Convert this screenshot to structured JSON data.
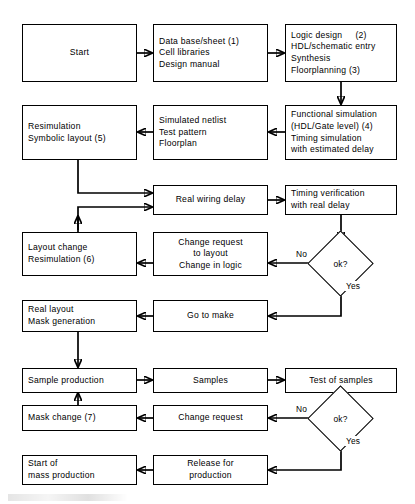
{
  "diagram": {
    "type": "flowchart",
    "line_color": "#000000",
    "background_color": "#ffffff"
  },
  "nodes": [
    {
      "id": "start",
      "shape": "process",
      "align": "center",
      "lines": [
        "Start"
      ]
    },
    {
      "id": "database",
      "shape": "process",
      "align": "left",
      "lines": [
        "Data base/sheet (1)",
        "Cell libraries",
        "Design manual"
      ]
    },
    {
      "id": "logic_design",
      "shape": "process",
      "align": "left",
      "lines": [
        "Logic design     (2)",
        "HDL/schematic entry",
        "Synthesis",
        "Floorplanning (3)"
      ]
    },
    {
      "id": "resimulation",
      "shape": "process",
      "align": "left",
      "lines": [
        "Resimulation",
        "Symbolic layout (5)"
      ]
    },
    {
      "id": "sim_netlist",
      "shape": "process",
      "align": "left",
      "lines": [
        "Simulated netlist",
        "Test pattern",
        "Floorplan"
      ]
    },
    {
      "id": "func_sim",
      "shape": "process",
      "align": "left",
      "lines": [
        "Functional simulation",
        "(HDL/Gate level) (4)",
        "Timing simulation",
        "with estimated delay"
      ]
    },
    {
      "id": "real_wiring",
      "shape": "process",
      "align": "center",
      "lines": [
        "Real wiring delay"
      ]
    },
    {
      "id": "timing_verif",
      "shape": "process",
      "align": "left",
      "lines": [
        "Timing verification",
        "with real delay"
      ]
    },
    {
      "id": "layout_change",
      "shape": "process",
      "align": "left",
      "lines": [
        "Layout change",
        "Resimulation (6)"
      ]
    },
    {
      "id": "change_request_layout",
      "shape": "process",
      "align": "center",
      "lines": [
        "Change request",
        "to layout",
        "Change in logic"
      ]
    },
    {
      "id": "ok1",
      "shape": "decision",
      "align": "center",
      "lines": [
        "ok?"
      ]
    },
    {
      "id": "real_layout",
      "shape": "process",
      "align": "left",
      "lines": [
        "Real layout",
        "Mask generation"
      ]
    },
    {
      "id": "go_to_make",
      "shape": "process",
      "align": "center",
      "lines": [
        "Go to make"
      ]
    },
    {
      "id": "sample_production",
      "shape": "process",
      "align": "left",
      "lines": [
        "Sample production"
      ]
    },
    {
      "id": "samples",
      "shape": "process",
      "align": "center",
      "lines": [
        "Samples"
      ]
    },
    {
      "id": "test_samples",
      "shape": "process",
      "align": "center",
      "lines": [
        "Test of samples"
      ]
    },
    {
      "id": "mask_change",
      "shape": "process",
      "align": "left",
      "lines": [
        "Mask change (7)"
      ]
    },
    {
      "id": "change_request",
      "shape": "process",
      "align": "center",
      "lines": [
        "Change request"
      ]
    },
    {
      "id": "ok2",
      "shape": "decision",
      "align": "center",
      "lines": [
        "ok?"
      ]
    },
    {
      "id": "start_mass",
      "shape": "process",
      "align": "left",
      "lines": [
        "Start of",
        "mass production"
      ]
    },
    {
      "id": "release",
      "shape": "process",
      "align": "center",
      "lines": [
        "Release for",
        "production"
      ]
    }
  ],
  "edge_labels": [
    {
      "id": "no1",
      "text": "No"
    },
    {
      "id": "yes1",
      "text": "Yes"
    },
    {
      "id": "no2",
      "text": "No"
    },
    {
      "id": "yes2",
      "text": "Yes"
    }
  ]
}
